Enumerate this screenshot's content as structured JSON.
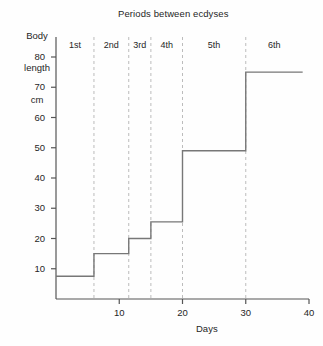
{
  "chart_data": {
    "type": "line",
    "subtype": "step-post",
    "title": "Periods between ecdyses",
    "xlabel": "Days",
    "ylabel_lines": [
      "Body",
      "length",
      "cm"
    ],
    "ylabel": "Body length cm",
    "xlim": [
      0,
      40
    ],
    "ylim": [
      0,
      85
    ],
    "grid": false,
    "legend": null,
    "x_ticks": [
      10,
      20,
      30,
      40
    ],
    "x_tick_labels": [
      "10",
      "20",
      "30",
      "40"
    ],
    "y_ticks": [
      10,
      20,
      30,
      40,
      50,
      60,
      70,
      80
    ],
    "y_tick_labels": [
      "10",
      "20",
      "30",
      "40",
      "50",
      "60",
      "70",
      "80"
    ],
    "x": [
      0,
      6,
      11.5,
      15,
      20,
      30,
      39
    ],
    "values": [
      7.5,
      15,
      20,
      25.5,
      49,
      75,
      75
    ],
    "steps": [
      {
        "period": "1st",
        "x_start": 0,
        "x_end": 6,
        "length_cm": 7.5
      },
      {
        "period": "2nd",
        "x_start": 6,
        "x_end": 11.5,
        "length_cm": 15
      },
      {
        "period": "3rd",
        "x_start": 11.5,
        "x_end": 15,
        "length_cm": 20
      },
      {
        "period": "4th",
        "x_start": 15,
        "x_end": 20,
        "length_cm": 25.5
      },
      {
        "period": "5th",
        "x_start": 20,
        "x_end": 30,
        "length_cm": 49
      },
      {
        "period": "6th",
        "x_start": 30,
        "x_end": 39,
        "length_cm": 75
      }
    ],
    "ecdysis_lines": [
      6,
      11.5,
      15,
      20,
      30
    ],
    "period_labels": [
      "1st",
      "2nd",
      "3rd",
      "4th",
      "5th",
      "6th"
    ],
    "colors": {
      "background": "#fefefe",
      "axis": "#555555",
      "data_line": "#777777",
      "ecdysis_line": "#bcbcbc",
      "text": "#262626"
    }
  }
}
